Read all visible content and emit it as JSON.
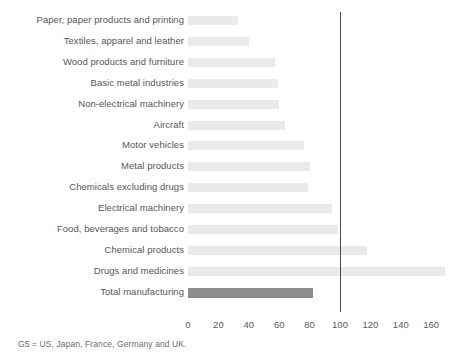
{
  "chart_data": {
    "type": "bar",
    "orientation": "horizontal",
    "title": "",
    "xlabel": "",
    "ylabel": "",
    "xlim": [
      0,
      172
    ],
    "grid": false,
    "legend": null,
    "categories": [
      "Paper, paper products and printing",
      "Textiles, apparel and leather",
      "Wood products and furniture",
      "Basic metal industries",
      "Non-electrical machinery",
      "Aircraft",
      "Motor vehicles",
      "Metal products",
      "Chemicals excluding drugs",
      "Electrical machinery",
      "Food, beverages and tobacco",
      "Chemical products",
      "Drugs and medicines",
      "Total manufacturing"
    ],
    "values": [
      33,
      40,
      57,
      59,
      60,
      64,
      76,
      80,
      79,
      95,
      99,
      118,
      169,
      82
    ],
    "tick_values": [
      0,
      20,
      40,
      60,
      80,
      100,
      120,
      140,
      160
    ],
    "tick_labels": [
      "0",
      "20",
      "40",
      "60",
      "80",
      "100",
      "120",
      "140",
      "160"
    ],
    "reference_line": {
      "value": 100,
      "color": "#4a4a4a"
    },
    "colors": {
      "bar": "#eaeaea",
      "highlight_bar": "#8c8c8c",
      "text": "#555555",
      "axis_text": "#5a5a5a",
      "footnote_text": "#6b6b6b",
      "background": "#ffffff"
    },
    "highlight_index": 13
  },
  "footnote": "G5 = US, Japan, France, Germany and UK."
}
